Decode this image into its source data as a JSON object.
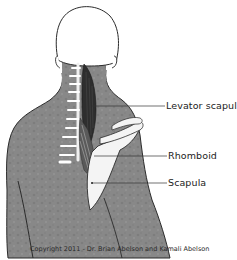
{
  "diagram": {
    "labels": [
      {
        "id": "levator",
        "text": "Levator scapulae"
      },
      {
        "id": "rhomboid",
        "text": "Rhomboid"
      },
      {
        "id": "scapula",
        "text": "Scapula"
      }
    ],
    "copyright": "Copyright 2011 - Dr. Brian Abelson and Kamali Abelson",
    "colors": {
      "skin": "#8a8a8a",
      "skin_dark": "#6f6f6f",
      "outline": "#2b2b2b",
      "bone": "#f4f4f4",
      "muscle": "#2e2e2e",
      "head": "#ffffff"
    }
  }
}
